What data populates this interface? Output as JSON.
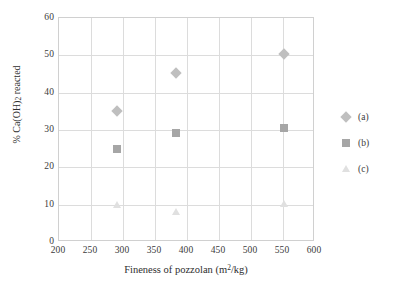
{
  "chart_data": {
    "type": "scatter",
    "title": "",
    "xlabel": "Fineness of pozzolan (m2/kg)",
    "xlabel_base": "Fineness of pozzolan (m",
    "xlabel_sup": "2",
    "xlabel_tail": "/kg)",
    "ylabel": "% Ca(OH)2 reacted",
    "ylabel_pre": "% Ca(OH)",
    "ylabel_sub": "2",
    "ylabel_post": " reacted",
    "xlim": [
      200,
      600
    ],
    "ylim": [
      0,
      60
    ],
    "xticks": [
      200,
      250,
      300,
      350,
      400,
      450,
      500,
      550,
      600
    ],
    "yticks": [
      0,
      10,
      20,
      30,
      40,
      50,
      60
    ],
    "grid": true,
    "legend_position": "right",
    "series": [
      {
        "name": "(a)",
        "marker": "diamond",
        "color": "#bfbfbf",
        "points": [
          {
            "x": 290,
            "y": 35.2
          },
          {
            "x": 383,
            "y": 45.2
          },
          {
            "x": 552,
            "y": 50.4
          }
        ]
      },
      {
        "name": "(b)",
        "marker": "square",
        "color": "#a6a6a6",
        "points": [
          {
            "x": 290,
            "y": 25.0
          },
          {
            "x": 383,
            "y": 29.2
          },
          {
            "x": 552,
            "y": 30.5
          }
        ]
      },
      {
        "name": "(c)",
        "marker": "triangle",
        "color": "#e0e0e0",
        "points": [
          {
            "x": 290,
            "y": 9.8
          },
          {
            "x": 383,
            "y": 8.0
          },
          {
            "x": 552,
            "y": 10.2
          }
        ]
      }
    ]
  },
  "legend": {
    "items": [
      {
        "label": "(a)"
      },
      {
        "label": "(b)"
      },
      {
        "label": "(c)"
      }
    ]
  }
}
